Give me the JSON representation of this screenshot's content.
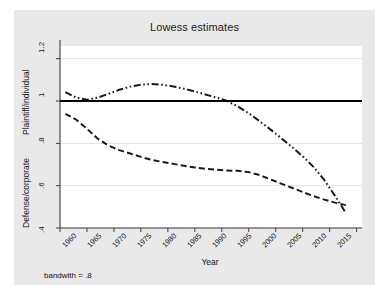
{
  "chart_data": {
    "type": "line",
    "title": "Lowess estimates",
    "xlabel": "Year",
    "ylabel_top": "Plaintiff/individual",
    "ylabel_bottom": "Defense/corporate",
    "note": "bandwith = .8",
    "xlim": [
      1960,
      2016
    ],
    "ylim": [
      0.4,
      1.26
    ],
    "grid": true,
    "grid_axis": "y",
    "legend_position": "inline-annotations",
    "xticks": [
      1960,
      1965,
      1970,
      1975,
      1980,
      1985,
      1990,
      1995,
      2000,
      2005,
      2010,
      2015
    ],
    "xticklabels": [
      "1960",
      "1965",
      "1970",
      "1975",
      "1980",
      "1985",
      "1990",
      "1995",
      "2000",
      "2005",
      "2010",
      "2015"
    ],
    "yticks": [
      0.4,
      0.6,
      0.8,
      1.0,
      1.2
    ],
    "yticklabels": [
      ".4",
      ".6",
      ".8",
      "1",
      "1.2"
    ],
    "series": [
      {
        "name": "Plaintiff v. Defense",
        "style": "dash-dot-dot",
        "color": "#1a1a1a",
        "x": [
          1961,
          1963,
          1965,
          1967,
          1969,
          1971,
          1973,
          1975,
          1977,
          1979,
          1981,
          1983,
          1985,
          1987,
          1989,
          1991,
          1993,
          1995,
          1997,
          1999,
          2001,
          2003,
          2005,
          2007,
          2009,
          2011,
          2013
        ],
        "values": [
          1.042,
          1.016,
          1.006,
          1.016,
          1.034,
          1.053,
          1.068,
          1.077,
          1.08,
          1.077,
          1.069,
          1.058,
          1.045,
          1.031,
          1.016,
          1.0,
          0.974,
          0.942,
          0.905,
          0.866,
          0.825,
          0.783,
          0.739,
          0.689,
          0.627,
          0.552,
          0.471
        ]
      },
      {
        "name": "Individual v. Corporate",
        "style": "dashed",
        "color": "#1a1a1a",
        "x": [
          1961,
          1963,
          1965,
          1967,
          1969,
          1971,
          1973,
          1975,
          1977,
          1979,
          1981,
          1983,
          1985,
          1987,
          1989,
          1991,
          1993,
          1995,
          1997,
          1999,
          2001,
          2003,
          2005,
          2007,
          2009,
          2011,
          2013
        ],
        "values": [
          0.939,
          0.912,
          0.869,
          0.822,
          0.789,
          0.768,
          0.752,
          0.736,
          0.722,
          0.712,
          0.703,
          0.694,
          0.686,
          0.68,
          0.675,
          0.672,
          0.67,
          0.664,
          0.65,
          0.63,
          0.61,
          0.59,
          0.57,
          0.551,
          0.534,
          0.52,
          0.508
        ]
      },
      {
        "name": "Parity",
        "style": "solid",
        "color": "#000000",
        "x": [
          1960,
          2016
        ],
        "values": [
          1.0,
          1.0
        ]
      }
    ],
    "annotations": [
      {
        "text": "Plaintiff v. Defense",
        "x": 1972.5,
        "y": 1.128
      },
      {
        "text": "Individual v. Corporate",
        "x": 1989.5,
        "y": 0.627
      },
      {
        "text": "Parity",
        "x": 2001.5,
        "y": 1.047
      }
    ]
  },
  "colors": {
    "figure_background": "#e9e9e9",
    "plot_background": "#ffffff",
    "axis": "#3c3c3c",
    "gridline": "#e2e2e2",
    "text": "#111111"
  }
}
